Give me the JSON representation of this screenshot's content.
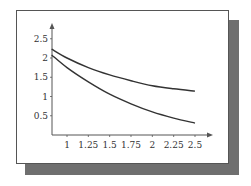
{
  "chart_data": {
    "type": "line",
    "title": "",
    "xlabel": "",
    "ylabel": "",
    "xlim": [
      0.82,
      2.5
    ],
    "ylim": [
      0,
      2.7
    ],
    "grid": false,
    "x_ticks": [
      "1",
      "1.25",
      "1.5",
      "1.75",
      "2",
      "2.25",
      "2.5"
    ],
    "y_ticks": [
      "0.5",
      "1",
      "1.5",
      "2",
      "2.5"
    ],
    "x": [
      0.82,
      1.0,
      1.25,
      1.5,
      1.75,
      2.0,
      2.25,
      2.5
    ],
    "series": [
      {
        "name": "upper curve",
        "values": [
          2.23,
          2.0,
          1.75,
          1.56,
          1.41,
          1.28,
          1.2,
          1.14
        ]
      },
      {
        "name": "lower curve",
        "values": [
          2.08,
          1.75,
          1.38,
          1.06,
          0.81,
          0.6,
          0.44,
          0.31
        ]
      }
    ],
    "legend": null
  },
  "colors": {
    "line": "#333333",
    "shadow": "#6f6f6f",
    "axis": "#555555"
  }
}
